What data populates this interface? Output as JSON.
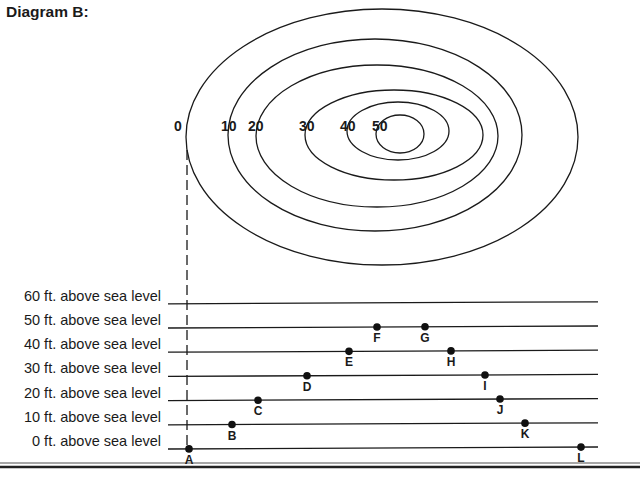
{
  "title": "Diagram B:",
  "contour_map": {
    "contours": [
      {
        "label": "0",
        "elevation_ft": 0
      },
      {
        "label": "10",
        "elevation_ft": 10
      },
      {
        "label": "20",
        "elevation_ft": 20
      },
      {
        "label": "30",
        "elevation_ft": 30
      },
      {
        "label": "40",
        "elevation_ft": 40
      },
      {
        "label": "50",
        "elevation_ft": 50
      }
    ]
  },
  "profile": {
    "levels": [
      {
        "elevation_ft": 60,
        "label": "60 ft. above sea level"
      },
      {
        "elevation_ft": 50,
        "label": "50 ft. above sea level"
      },
      {
        "elevation_ft": 40,
        "label": "40 ft. above sea level"
      },
      {
        "elevation_ft": 30,
        "label": "30 ft. above sea level"
      },
      {
        "elevation_ft": 20,
        "label": "20 ft. above sea level"
      },
      {
        "elevation_ft": 10,
        "label": "10 ft. above sea level"
      },
      {
        "elevation_ft": 0,
        "label": "0 ft. above sea level"
      }
    ],
    "points": [
      {
        "label": "A",
        "elevation_ft": 0
      },
      {
        "label": "B",
        "elevation_ft": 10
      },
      {
        "label": "C",
        "elevation_ft": 20
      },
      {
        "label": "D",
        "elevation_ft": 30
      },
      {
        "label": "E",
        "elevation_ft": 40
      },
      {
        "label": "F",
        "elevation_ft": 50
      },
      {
        "label": "G",
        "elevation_ft": 50
      },
      {
        "label": "H",
        "elevation_ft": 40
      },
      {
        "label": "I",
        "elevation_ft": 30
      },
      {
        "label": "J",
        "elevation_ft": 20
      },
      {
        "label": "K",
        "elevation_ft": 10
      },
      {
        "label": "L",
        "elevation_ft": 0
      }
    ]
  }
}
